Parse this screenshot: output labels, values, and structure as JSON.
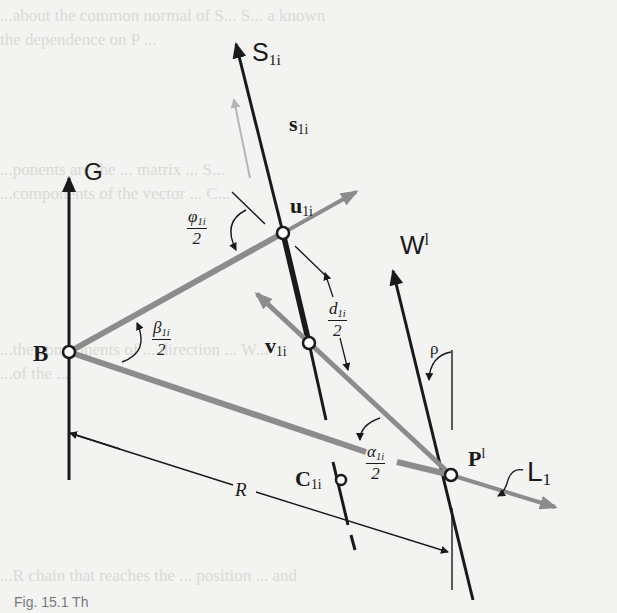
{
  "figure": {
    "caption_fragment": "Fig. 15.1 Th",
    "background_text_lines": [
      "...about the common normal of S... S... a known",
      "the dependence on P ...",
      "...ponents are the ... matrix ... S...",
      "...components of the vector ... C...",
      "...the components of ... direction ... W...",
      "...of the ... ",
      "...R chain that reaches the ... position ... and"
    ]
  },
  "colors": {
    "background": "#f3f3f1",
    "ink": "#1a1a1a",
    "grey_link": "#8c8c8c",
    "light_arrow": "#b5b5b5"
  },
  "labels": {
    "G": {
      "text": "G"
    },
    "S_axis": {
      "base": "S",
      "sub": "1i"
    },
    "s_unit": {
      "base": "s",
      "sub": "1i"
    },
    "u": {
      "base": "u",
      "sub": "1i"
    },
    "v": {
      "base": "v",
      "sub": "1i"
    },
    "B": {
      "text": "B"
    },
    "C": {
      "base": "C",
      "sub": "1i"
    },
    "P": {
      "base": "P",
      "sup": "l"
    },
    "W": {
      "base": "W",
      "sup": "l"
    },
    "L": {
      "base": "L",
      "sub": "1"
    },
    "R": {
      "text": "R"
    },
    "rho": {
      "text": "ρ"
    },
    "phi_half": {
      "num": "φ",
      "num_sub": "1i",
      "den": "2"
    },
    "beta_half": {
      "num": "β",
      "num_sub": "1i",
      "den": "2"
    },
    "d_half": {
      "num": "d",
      "num_sub": "1i",
      "den": "2"
    },
    "alpha_half": {
      "num": "α",
      "num_sub": "1i",
      "den": "2"
    }
  },
  "points": {
    "B": [
      69,
      352
    ],
    "u1i": [
      283,
      233
    ],
    "v1i": [
      309,
      343
    ],
    "C1i": [
      341,
      480
    ],
    "Pl": [
      451,
      475
    ]
  }
}
